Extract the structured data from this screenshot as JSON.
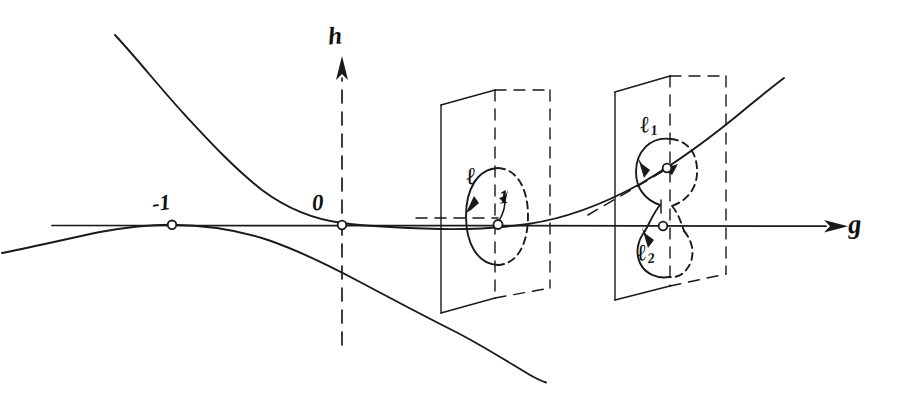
{
  "figure": {
    "medium": "pen-on-paper line drawing, black ink on white",
    "background_color": "#ffffff",
    "ink_color": "#1a1a1a"
  },
  "axes": {
    "horizontal": {
      "name": "g-axis",
      "label": "g",
      "style": "solid line with arrowhead at right end",
      "arrow_direction": "right"
    },
    "vertical": {
      "name": "h-axis",
      "label": "h",
      "style": "dashed line with arrowhead at top end",
      "arrow_direction": "up"
    }
  },
  "marked_points": [
    {
      "name": "point-minus-one",
      "label": "-1",
      "on_axis": "g",
      "marker": "small open circle"
    },
    {
      "name": "point-zero",
      "label": "0",
      "on_axis": "g",
      "marker": "small open circle"
    }
  ],
  "curves": [
    {
      "name": "upper-branch",
      "description": "descending branch entering at upper left, tangent to the g-axis at -1, continuing right and rising beyond the planes"
    },
    {
      "name": "lower-branch",
      "description": "branch approaching the g-axis from below at the left, touching near -1 and descending steeply to the lower right"
    }
  ],
  "planes": [
    {
      "name": "middle-plane",
      "description": "vertical transversal plane in perspective; front edge solid, back edge dashed",
      "contains_loop": "loop-l"
    },
    {
      "name": "right-plane",
      "description": "vertical transversal plane in perspective; front edge solid, back edge dashed",
      "contains_loops": [
        "loop-l1",
        "loop-l2"
      ]
    }
  ],
  "loops": [
    {
      "name": "loop-l",
      "label": "ℓ",
      "plane": "middle-plane",
      "shape": "single oriented oval (solid in front, dashed behind) encircling the intersection point",
      "orientation": "counterclockwise, arrow on left side",
      "inner_label": "1"
    },
    {
      "name": "loop-l1",
      "label": "ℓ",
      "subscript": "1",
      "plane": "right-plane",
      "shape": "upper lobe of a figure-eight encircling the point where the curve meets the plane",
      "orientation": "arrowed"
    },
    {
      "name": "loop-l2",
      "label": "ℓ",
      "subscript": "2",
      "plane": "right-plane",
      "shape": "lower lobe of a figure-eight encircling the point on the g-axis",
      "orientation": "arrowed"
    }
  ],
  "labels": {
    "axis_g": "g",
    "axis_h": "h",
    "minus_one": "-1",
    "zero": "0",
    "loop_l": "ℓ",
    "loop_l1_base": "ℓ",
    "loop_l1_sub": "1",
    "loop_l2_base": "ℓ",
    "loop_l2_sub": "2",
    "loop_inner_one": "1"
  }
}
